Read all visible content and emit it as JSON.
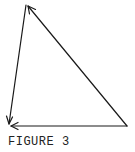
{
  "figure": {
    "caption": "FIGURE 3",
    "stroke_color": "#1a1a1a",
    "vertices": {
      "top": [
        27,
        5
      ],
      "bottom_left": [
        9,
        125
      ],
      "bottom_right": [
        127,
        126
      ]
    },
    "edges": [
      {
        "from": "bottom_right",
        "to": "top",
        "arrowhead": "top"
      },
      {
        "from": "top",
        "to": "bottom_left",
        "arrowhead": "bottom_left"
      },
      {
        "from": "bottom_right",
        "to": "bottom_left",
        "arrowhead": "bottom_left"
      }
    ]
  }
}
